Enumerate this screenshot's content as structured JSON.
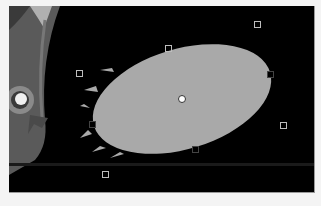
{
  "canvas": {
    "background": "#000000",
    "frame": {
      "x": 9,
      "y": 6,
      "width": 305,
      "height": 186
    }
  },
  "character": {
    "name": "cartoon-character-partial",
    "colors": {
      "body": "#5a5a5a",
      "rim": "#8a8a8a",
      "eye_white": "#f0f0f0",
      "horn": "#b0b0b0"
    }
  },
  "shape": {
    "type": "ellipse",
    "fill": "#a9a9a9",
    "center": {
      "x": 182,
      "y": 99
    },
    "rx": 92,
    "ry": 50,
    "rotation_deg": -17
  },
  "selection": {
    "pivot": {
      "x": 182,
      "y": 99
    },
    "handles": [
      {
        "id": "rotate-top-right",
        "x": 257,
        "y": 24,
        "on_shape": false
      },
      {
        "id": "top",
        "x": 168,
        "y": 48,
        "on_shape": false
      },
      {
        "id": "rotate-top-left",
        "x": 79,
        "y": 73,
        "on_shape": false
      },
      {
        "id": "right",
        "x": 270,
        "y": 74,
        "on_shape": true
      },
      {
        "id": "left",
        "x": 92,
        "y": 124,
        "on_shape": true
      },
      {
        "id": "rotate-bottom-right",
        "x": 283,
        "y": 125,
        "on_shape": false
      },
      {
        "id": "bottom",
        "x": 195,
        "y": 149,
        "on_shape": true
      },
      {
        "id": "rotate-bottom-left",
        "x": 105,
        "y": 174,
        "on_shape": false
      }
    ]
  }
}
